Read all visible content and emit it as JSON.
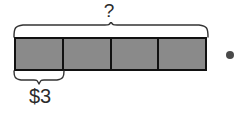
{
  "diagram": {
    "type": "tape-diagram",
    "title_label": "?",
    "part_label": "$3",
    "total_segments": 4,
    "labeled_segments": 1,
    "segments": [
      {
        "index": 1,
        "fill": "#8a8a8a"
      },
      {
        "index": 2,
        "fill": "#8a8a8a"
      },
      {
        "index": 3,
        "fill": "#8a8a8a"
      },
      {
        "index": 4,
        "fill": "#8a8a8a"
      }
    ],
    "braces": {
      "top": {
        "label": "?",
        "spans_segments": 4
      },
      "bottom": {
        "label": "$3",
        "spans_segments": 1
      }
    },
    "marker": {
      "shape": "dot",
      "color": "#4a4a4a"
    },
    "colors": {
      "segment_fill": "#8a8a8a",
      "outline": "#111111",
      "brace_stroke": "#333333",
      "text": "#2b2b2b",
      "background": "#ffffff"
    }
  }
}
